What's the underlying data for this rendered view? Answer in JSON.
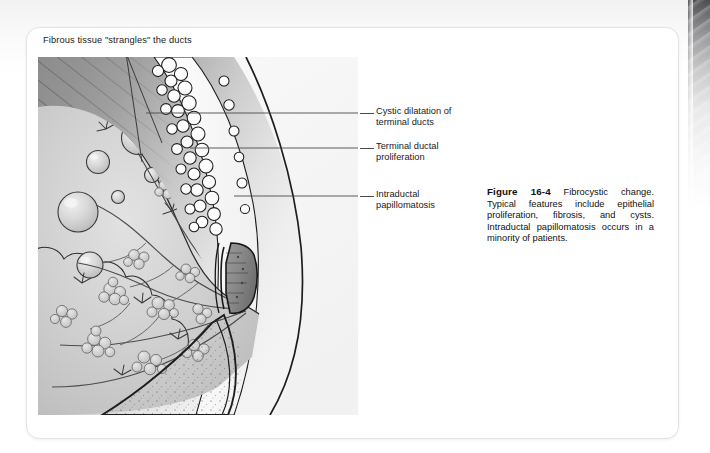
{
  "page": {
    "background_color": "#ffffff",
    "card_color": "#ffffff",
    "card_border_color": "#e3e3e3"
  },
  "figure": {
    "top_callout": {
      "label": "Fibrous tissue \"strangles\" the ducts"
    },
    "side_callouts": [
      {
        "id": "cystic-dilatation",
        "label": "Cystic dilatation of\nterminal ducts"
      },
      {
        "id": "terminal-ductal-proliferation",
        "label": "Terminal ductal\nproliferation"
      },
      {
        "id": "intraductal-papillomatosis",
        "label": "Intraductal\npapillomatosis"
      }
    ],
    "caption": {
      "number": "Figure 16-4",
      "text": " Fibrocystic change. Typical features include epithelial proliferation, fibrosis, and cysts. Intraductal papillomatosis occurs in a minority of patients."
    },
    "illustration": {
      "alt": "Sagittal cross-section illustration of a breast showing fibrocystic change with cysts, dilated terminal ducts, lobular acini clusters, subcutaneous fat, nipple, and pectoral muscle hatching.",
      "colors": {
        "deep_tissue": "#8c8c8c",
        "gland_tissue": "#c9c9c9",
        "cyst_fill": "#d6d6d6",
        "outline": "#2b2b2b",
        "background_light": "#f5f5f5"
      }
    }
  }
}
